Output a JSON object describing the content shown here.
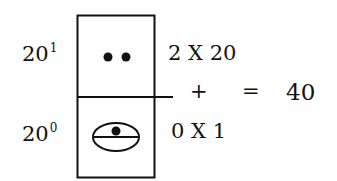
{
  "diagram": {
    "rows": [
      {
        "place_base": "20",
        "place_exponent": "1",
        "glyph": "two-dots",
        "digit_value": "2",
        "expression": "2 X 20"
      },
      {
        "place_base": "20",
        "place_exponent": "0",
        "glyph": "shell-zero",
        "digit_value": "0",
        "expression": "0 X 1"
      }
    ],
    "operator_plus": "+",
    "operator_equals": "=",
    "result": "40",
    "colors": {
      "ink": "#111111",
      "background": "#ffffff"
    }
  }
}
